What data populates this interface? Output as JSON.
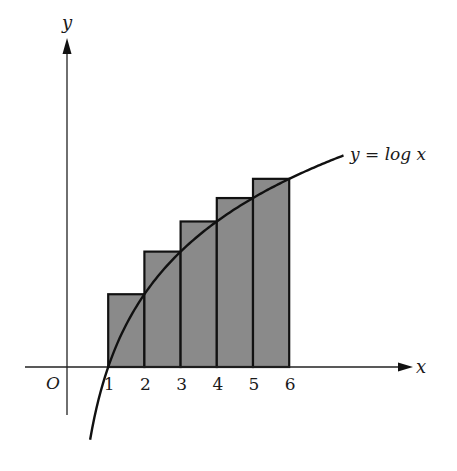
{
  "chart_data": {
    "type": "bar",
    "title": "",
    "xlabel": "x",
    "ylabel": "y",
    "origin_label": "O",
    "curve_label": "y = log x",
    "curve": {
      "function": "log",
      "x_start": 0.5,
      "x_end": 7.5
    },
    "categories": [
      "1",
      "2",
      "3",
      "4",
      "5",
      "6"
    ],
    "rectangles": [
      {
        "x_from": 1,
        "x_to": 2,
        "height": 0.693
      },
      {
        "x_from": 2,
        "x_to": 3,
        "height": 1.099
      },
      {
        "x_from": 3,
        "x_to": 4,
        "height": 1.386
      },
      {
        "x_from": 4,
        "x_to": 5,
        "height": 1.609
      },
      {
        "x_from": 5,
        "x_to": 6,
        "height": 1.792
      }
    ],
    "grid": false,
    "legend": "none"
  },
  "labels": {
    "y_axis": "y",
    "x_axis": "x",
    "origin": "O",
    "curve": "y = log x",
    "ticks": [
      "1",
      "2",
      "3",
      "4",
      "5",
      "6"
    ]
  },
  "colors": {
    "fill": "#8a8a8a",
    "stroke": "#111111"
  }
}
